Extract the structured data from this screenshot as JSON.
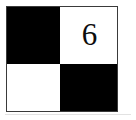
{
  "figure": {
    "kind": "checkerboard-tile",
    "outline_color": "#3a3a3a",
    "background_color": "#ffffff",
    "cells": [
      {
        "position": "top-left",
        "fill": "black",
        "color": "#000000",
        "label": ""
      },
      {
        "position": "top-right",
        "fill": "white",
        "color": "#ffffff",
        "label": "6"
      },
      {
        "position": "bottom-left",
        "fill": "white",
        "color": "#ffffff",
        "label": ""
      },
      {
        "position": "bottom-right",
        "fill": "black",
        "color": "#000000",
        "label": ""
      }
    ],
    "digit": {
      "value": "6",
      "color": "#0d0d0d",
      "cell": "top-right"
    },
    "baseline_rule_color": "#e2e2e2"
  }
}
